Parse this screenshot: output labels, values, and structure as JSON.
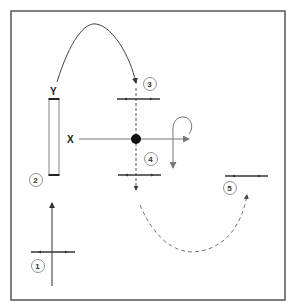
{
  "diagram": {
    "type": "movement-diagram",
    "axis_labels": {
      "x": "X",
      "y": "Y"
    },
    "steps": [
      {
        "id": 1,
        "label": "1"
      },
      {
        "id": 2,
        "label": "2"
      },
      {
        "id": 3,
        "label": "3"
      },
      {
        "id": 4,
        "label": "4"
      },
      {
        "id": 5,
        "label": "5"
      }
    ],
    "colors": {
      "frame": "#555555",
      "line": "#444444",
      "light_line": "#777777",
      "dot": "#111111",
      "background": "#ffffff"
    }
  }
}
